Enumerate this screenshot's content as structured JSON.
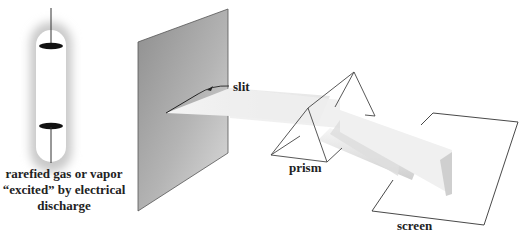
{
  "diagram": {
    "labels": {
      "slit": "slit",
      "prism": "prism",
      "screen": "screen",
      "source_line1": "rarefied gas or vapor",
      "source_line2": "“excited” by electrical",
      "source_line3": "discharge"
    },
    "components": [
      {
        "id": "gas-discharge-tube",
        "description": "glowing tube with two electrodes"
      },
      {
        "id": "slit-plate",
        "description": "gray opaque plate with narrow slit"
      },
      {
        "id": "light-beam",
        "description": "pale beam passing from slit to prism"
      },
      {
        "id": "prism",
        "description": "triangular glass prism (wireframe)"
      },
      {
        "id": "dispersed-beams",
        "description": "separate light bands emerging from prism"
      },
      {
        "id": "screen",
        "description": "flat viewing screen (outline)"
      }
    ],
    "colors": {
      "plate_dark": "#8a8a8a",
      "plate_light": "#d6d6d6",
      "beam": "#ececec",
      "line": "#444444",
      "electrode": "#111111"
    }
  }
}
